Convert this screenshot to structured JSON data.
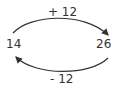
{
  "diagram": {
    "left_value": "14",
    "right_value": "26",
    "top_arrow": {
      "label": "+ 12",
      "direction": "left-to-right"
    },
    "bottom_arrow": {
      "label": "- 12",
      "direction": "right-to-left"
    }
  }
}
